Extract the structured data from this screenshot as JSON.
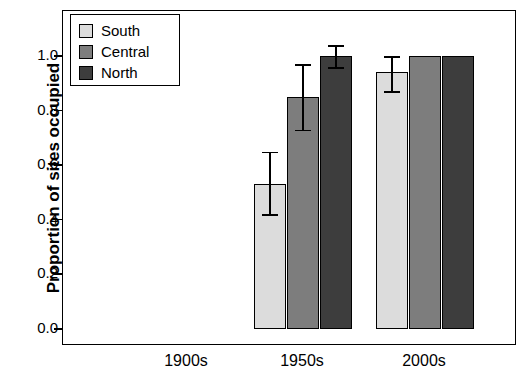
{
  "chart_data": {
    "type": "bar",
    "title": "",
    "xlabel": "",
    "ylabel": "Proportion of sites occupied",
    "categories": [
      "1900s",
      "1950s",
      "2000s"
    ],
    "ylim": [
      0.0,
      1.0
    ],
    "ytick_labels": [
      "0.0",
      "0.2",
      "0.4",
      "0.6",
      "0.8",
      "1.0"
    ],
    "ytick_values": [
      0.0,
      0.2,
      0.4,
      0.6,
      0.8,
      1.0
    ],
    "grid": false,
    "legend_position": "top-left",
    "series": [
      {
        "name": "South",
        "color": "#dcdcdc",
        "values": [
          0.0,
          0.53,
          0.94
        ],
        "err_low": [
          0.0,
          0.42,
          0.87
        ],
        "err_high": [
          0.0,
          0.65,
          1.0
        ]
      },
      {
        "name": "Central",
        "color": "#7d7d7d",
        "values": [
          0.0,
          0.85,
          1.0
        ],
        "err_low": [
          0.0,
          0.73,
          1.0
        ],
        "err_high": [
          0.0,
          0.97,
          1.0
        ]
      },
      {
        "name": "North",
        "color": "#3d3d3d",
        "values": [
          0.0,
          1.0,
          1.0
        ],
        "err_low": [
          0.0,
          0.96,
          1.0
        ],
        "err_high": [
          0.0,
          1.04,
          1.0
        ]
      }
    ]
  },
  "legend": {
    "items": [
      {
        "label": "South",
        "color": "#dcdcdc"
      },
      {
        "label": "Central",
        "color": "#7d7d7d"
      },
      {
        "label": "North",
        "color": "#3d3d3d"
      }
    ]
  },
  "axes": {
    "y_title": "Proportion of sites occupied",
    "y_ticks": [
      "0.0",
      "0.2",
      "0.4",
      "0.6",
      "0.8",
      "1.0"
    ],
    "x_ticks": [
      "1900s",
      "1950s",
      "2000s"
    ]
  }
}
